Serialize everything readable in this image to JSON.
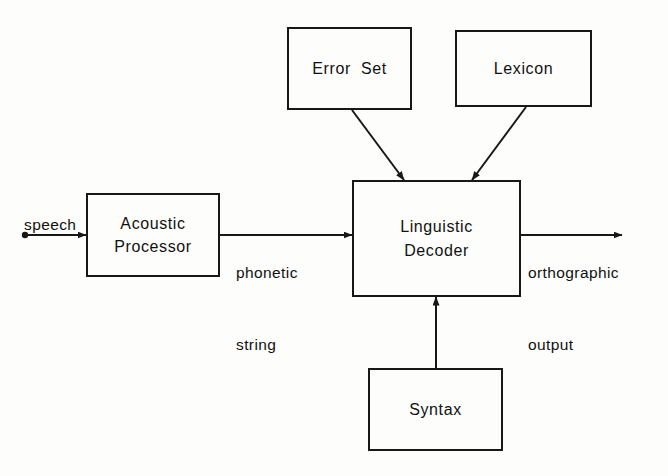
{
  "diagram": {
    "background_color": "#fdfdfb",
    "stroke_color": "#181818",
    "text_color": "#111111",
    "boxes": [
      {
        "id": "error-set",
        "label": "Error  Set",
        "x": 287,
        "y": 27,
        "w": 125,
        "h": 83
      },
      {
        "id": "lexicon",
        "label": "Lexicon",
        "x": 455,
        "y": 30,
        "w": 137,
        "h": 77
      },
      {
        "id": "acoustic-processor",
        "label_line1": "Acoustic",
        "label_line2": "Processor",
        "x": 86,
        "y": 193,
        "w": 134,
        "h": 84
      },
      {
        "id": "linguistic-decoder",
        "label_line1": "Linguistic",
        "label_line2": "Decoder",
        "x": 352,
        "y": 180,
        "w": 169,
        "h": 117
      },
      {
        "id": "syntax",
        "label": "Syntax",
        "x": 368,
        "y": 368,
        "w": 135,
        "h": 83
      }
    ],
    "edge_labels": {
      "speech": "speech",
      "phonetic_line1": "phonetic",
      "phonetic_line2": "string",
      "orthographic_line1": "orthographic",
      "orthographic_line2": "output"
    },
    "connections": [
      {
        "id": "speech-input",
        "from": "source-dot",
        "to": "acoustic-processor",
        "style": "horizontal-arrow"
      },
      {
        "id": "phonetic-string",
        "from": "acoustic-processor",
        "to": "linguistic-decoder",
        "style": "horizontal-arrow"
      },
      {
        "id": "orthographic-output",
        "from": "linguistic-decoder",
        "to": "sink",
        "style": "horizontal-arrow"
      },
      {
        "id": "error-set-feed",
        "from": "error-set",
        "to": "linguistic-decoder",
        "style": "diagonal-arrow"
      },
      {
        "id": "lexicon-feed",
        "from": "lexicon",
        "to": "linguistic-decoder",
        "style": "diagonal-arrow"
      },
      {
        "id": "syntax-feed",
        "from": "syntax",
        "to": "linguistic-decoder",
        "style": "vertical-arrow"
      }
    ]
  }
}
